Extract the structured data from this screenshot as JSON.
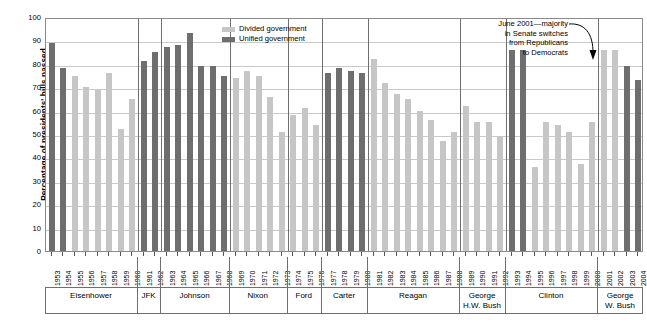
{
  "chart_data": {
    "type": "bar",
    "title": "",
    "xlabel": "",
    "ylabel": "Percentage of presidents' bills passed",
    "ylim": [
      0,
      100
    ],
    "ytick_step": 10,
    "yticks": [
      100,
      90,
      80,
      70,
      60,
      50,
      40,
      30,
      20,
      10,
      0
    ],
    "grid": true,
    "legend_position": "top-right-inside",
    "colors": {
      "divided": "#c6c6c6",
      "unified": "#6e6e6e",
      "gridline": "#c9c9c9",
      "axis": "#6f6f6f"
    },
    "legend": [
      {
        "label": "Divided government",
        "key": "divided"
      },
      {
        "label": "Unified government",
        "key": "unified"
      }
    ],
    "annotations": [
      {
        "text": "June 2001—majority in Senate switches from Republicans to Democrats",
        "lines": [
          "June 2001—majority",
          "in Senate switches",
          "from Republicans",
          "to Democrats"
        ],
        "points_to_year": "2001"
      }
    ],
    "categories": [
      "1953",
      "1954",
      "1955",
      "1956",
      "1957",
      "1958",
      "1959",
      "1960",
      "1961",
      "1962",
      "1963",
      "1964",
      "1965",
      "1966",
      "1967",
      "1968",
      "1969",
      "1970",
      "1971",
      "1972",
      "1973",
      "1974",
      "1975",
      "1976",
      "1977",
      "1978",
      "1979",
      "1980",
      "1981",
      "1982",
      "1983",
      "1984",
      "1985",
      "1986",
      "1987",
      "1988",
      "1989",
      "1990",
      "1991",
      "1992",
      "1993",
      "1994",
      "1995",
      "1996",
      "1997",
      "1998",
      "1999",
      "2000",
      "2001",
      "2002",
      "2003",
      "2004"
    ],
    "values": [
      89,
      78,
      75,
      70,
      69,
      76,
      52,
      65,
      81,
      85,
      87,
      88,
      93,
      79,
      79,
      75,
      74,
      77,
      75,
      66,
      51,
      58,
      61,
      54,
      76,
      78,
      77,
      76,
      82,
      72,
      67,
      65,
      60,
      56,
      47,
      51,
      62,
      55,
      55,
      49,
      86,
      86,
      36,
      55,
      54,
      51,
      37,
      55,
      86,
      86,
      79,
      73
    ],
    "types": [
      "unified",
      "unified",
      "divided",
      "divided",
      "divided",
      "divided",
      "divided",
      "divided",
      "unified",
      "unified",
      "unified",
      "unified",
      "unified",
      "unified",
      "unified",
      "unified",
      "divided",
      "divided",
      "divided",
      "divided",
      "divided",
      "divided",
      "divided",
      "divided",
      "unified",
      "unified",
      "unified",
      "unified",
      "divided",
      "divided",
      "divided",
      "divided",
      "divided",
      "divided",
      "divided",
      "divided",
      "divided",
      "divided",
      "divided",
      "divided",
      "unified",
      "unified",
      "divided",
      "divided",
      "divided",
      "divided",
      "divided",
      "divided",
      "divided",
      "divided",
      "unified",
      "unified"
    ],
    "groups": [
      {
        "name": "Eisenhower",
        "lines": [
          "Eisenhower"
        ],
        "start": "1953",
        "end": "1960"
      },
      {
        "name": "JFK",
        "lines": [
          "JFK"
        ],
        "start": "1961",
        "end": "1962"
      },
      {
        "name": "Johnson",
        "lines": [
          "Johnson"
        ],
        "start": "1963",
        "end": "1968"
      },
      {
        "name": "Nixon",
        "lines": [
          "Nixon"
        ],
        "start": "1969",
        "end": "1973"
      },
      {
        "name": "Ford",
        "lines": [
          "Ford"
        ],
        "start": "1974",
        "end": "1976"
      },
      {
        "name": "Carter",
        "lines": [
          "Carter"
        ],
        "start": "1977",
        "end": "1980"
      },
      {
        "name": "Reagan",
        "lines": [
          "Reagan"
        ],
        "start": "1981",
        "end": "1988"
      },
      {
        "name": "George H.W. Bush",
        "lines": [
          "George",
          "H.W. Bush"
        ],
        "start": "1989",
        "end": "1992"
      },
      {
        "name": "Clinton",
        "lines": [
          "Clinton"
        ],
        "start": "1993",
        "end": "2000"
      },
      {
        "name": "George W. Bush",
        "lines": [
          "George",
          "W. Bush"
        ],
        "start": "2001",
        "end": "2004"
      }
    ]
  }
}
